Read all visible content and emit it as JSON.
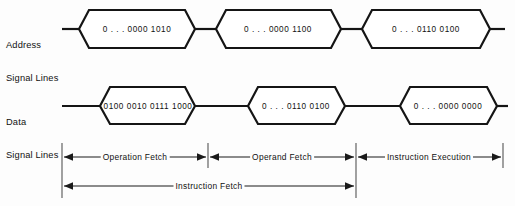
{
  "figure": {
    "background_color": "#fdfdfd",
    "line_color": "#151515"
  },
  "rows": [
    {
      "id": "address",
      "label_line1": "Address",
      "label_line2": "Signal Lines",
      "values": [
        "0 . . . 0000 1010",
        "0 . . . 0000 1100",
        "0 . . . 0110 0100"
      ]
    },
    {
      "id": "data",
      "label_line1": "Data",
      "label_line2": "Signal Lines",
      "values": [
        "0100 0010 0111 1000",
        "0 . . . 0110 0100",
        "0 . . . 0000 0000"
      ]
    }
  ],
  "phases": [
    {
      "label": "Operation Fetch"
    },
    {
      "label": "Operand Fetch"
    },
    {
      "label": "Instruction Execution"
    }
  ],
  "span": {
    "label": "Instruction Fetch"
  }
}
